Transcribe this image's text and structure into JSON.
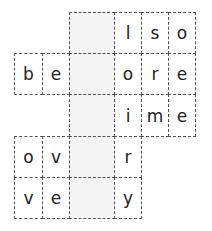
{
  "colors": {
    "shaded": "#f4f4f4",
    "border": "#555555",
    "text": "#222222"
  },
  "grid": {
    "cols": [
      14,
      42,
      69,
      114,
      141,
      168,
      195
    ],
    "rows": [
      12,
      53,
      94,
      136,
      177,
      218
    ],
    "cells": [
      {
        "r": 0,
        "c": 2,
        "letter": "",
        "shaded": true
      },
      {
        "r": 0,
        "c": 3,
        "letter": "l",
        "shaded": false
      },
      {
        "r": 0,
        "c": 4,
        "letter": "s",
        "shaded": false
      },
      {
        "r": 0,
        "c": 5,
        "letter": "o",
        "shaded": false
      },
      {
        "r": 1,
        "c": 0,
        "letter": "b",
        "shaded": false
      },
      {
        "r": 1,
        "c": 1,
        "letter": "e",
        "shaded": false
      },
      {
        "r": 1,
        "c": 2,
        "letter": "",
        "shaded": true
      },
      {
        "r": 1,
        "c": 3,
        "letter": "o",
        "shaded": false
      },
      {
        "r": 1,
        "c": 4,
        "letter": "r",
        "shaded": false
      },
      {
        "r": 1,
        "c": 5,
        "letter": "e",
        "shaded": false
      },
      {
        "r": 2,
        "c": 2,
        "letter": "",
        "shaded": true
      },
      {
        "r": 2,
        "c": 3,
        "letter": "i",
        "shaded": false
      },
      {
        "r": 2,
        "c": 4,
        "letter": "m",
        "shaded": false
      },
      {
        "r": 2,
        "c": 5,
        "letter": "e",
        "shaded": false
      },
      {
        "r": 3,
        "c": 0,
        "letter": "o",
        "shaded": false
      },
      {
        "r": 3,
        "c": 1,
        "letter": "v",
        "shaded": false
      },
      {
        "r": 3,
        "c": 2,
        "letter": "",
        "shaded": true
      },
      {
        "r": 3,
        "c": 3,
        "letter": "r",
        "shaded": false
      },
      {
        "r": 4,
        "c": 0,
        "letter": "v",
        "shaded": false
      },
      {
        "r": 4,
        "c": 1,
        "letter": "e",
        "shaded": false
      },
      {
        "r": 4,
        "c": 2,
        "letter": "",
        "shaded": true
      },
      {
        "r": 4,
        "c": 3,
        "letter": "y",
        "shaded": false
      }
    ]
  }
}
